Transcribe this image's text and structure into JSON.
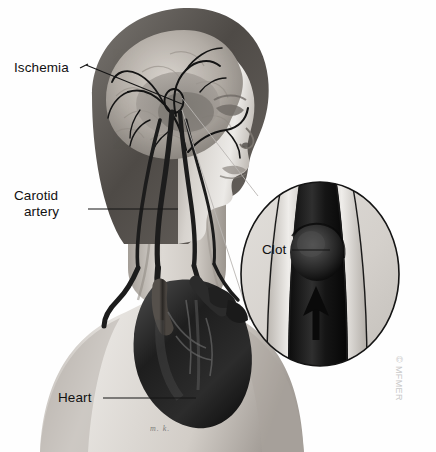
{
  "illustration": {
    "title": "Ischemic stroke - carotid artery clot",
    "style": "grayscale medical illustration",
    "background_color": "#ffffff",
    "subject": "Head and upper torso profile showing cerebral vasculature, carotid arteries and heart, with a magnified inset of an arterial clot"
  },
  "labels": {
    "ischemia": "Ischemia",
    "carotid_line1": "Carotid",
    "carotid_line2": "artery",
    "heart": "Heart",
    "clot": "Clot"
  },
  "inset": {
    "name": "magnified-artery-inset",
    "shape": "ellipse",
    "contents": "cross-section of carotid artery with occluding clot and upward blood-flow arrow"
  },
  "copyright": "© MFMER",
  "signature": "m. k.",
  "colors": {
    "ink": "#111111",
    "leader_line": "#1a1a1a",
    "skin_light": "#e3e0dc",
    "skin_mid": "#b9b4ae",
    "skin_shadow": "#8d8882",
    "hair": "#5d5954",
    "brain_light": "#cfcac4",
    "brain_mid": "#a39d96",
    "vessel": "#1b1b1b",
    "heart_dark": "#171717",
    "heart_mid": "#3a3a3a",
    "inset_fill": "#d9d6d1",
    "artery_wall": "#cdc8c2",
    "lumen": "#141414",
    "copyright_gray": "#c9c9c9"
  },
  "anatomy_parts": [
    {
      "name": "brain",
      "label": "cerebral cortex with arteries"
    },
    {
      "name": "ischemic-region",
      "label": "darkened ischemic brain tissue"
    },
    {
      "name": "face-profile",
      "label": "face in right profile"
    },
    {
      "name": "carotid-artery",
      "label": "common carotid artery"
    },
    {
      "name": "aortic-arch",
      "label": "aortic arch and great vessels"
    },
    {
      "name": "heart",
      "label": "heart"
    },
    {
      "name": "clot-marker",
      "label": "circled clot site on carotid artery"
    }
  ]
}
